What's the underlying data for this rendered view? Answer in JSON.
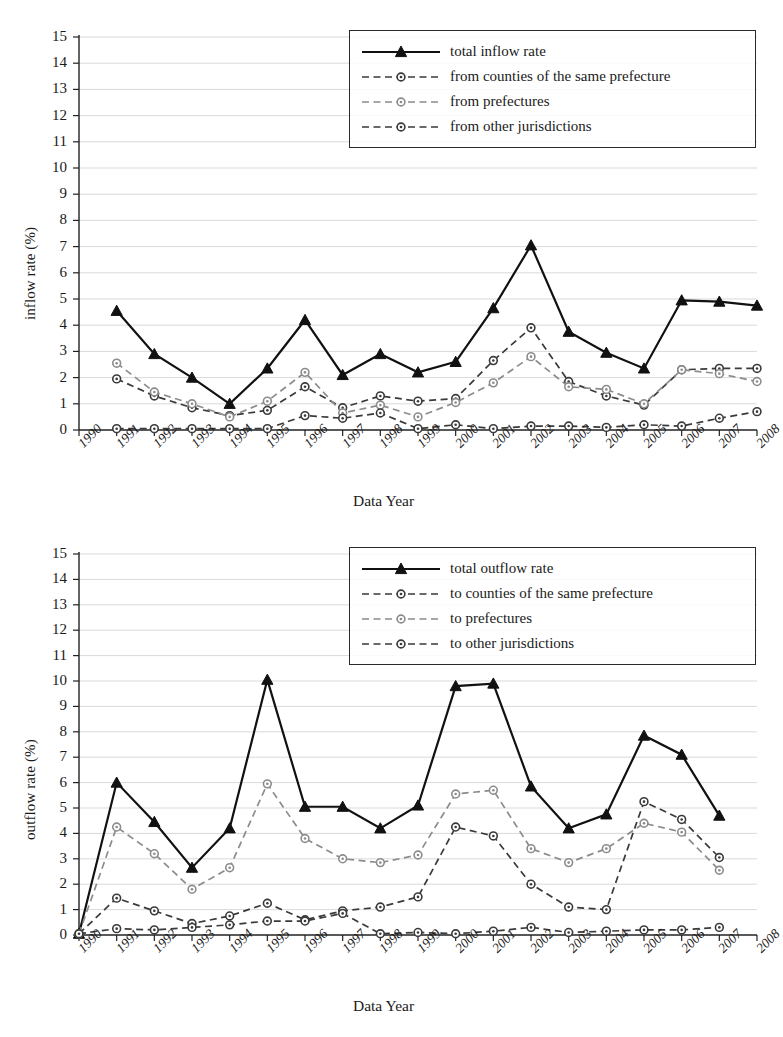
{
  "figure": {
    "panels": [
      {
        "id": "inflow",
        "ylabel": "inflow rate (%)",
        "xlabel": "Data Year",
        "legend": [
          {
            "label": "total inflow rate",
            "style": "solid-triangle"
          },
          {
            "label": "from counties of the same prefecture",
            "style": "dashed-circle-dark"
          },
          {
            "label": "from prefectures",
            "style": "dashed-circle-light"
          },
          {
            "label": "from other jurisdictions",
            "style": "dashed-circle-dark"
          }
        ]
      },
      {
        "id": "outflow",
        "ylabel": "outflow rate (%)",
        "xlabel": "Data Year",
        "legend": [
          {
            "label": "total outflow rate",
            "style": "solid-triangle"
          },
          {
            "label": "to counties of the same prefecture",
            "style": "dashed-circle-dark"
          },
          {
            "label": "to prefectures",
            "style": "dashed-circle-light"
          },
          {
            "label": "to other jurisdictions",
            "style": "dashed-circle-dark"
          }
        ]
      }
    ]
  },
  "chart_data": [
    {
      "type": "line",
      "id": "inflow",
      "title": "",
      "xlabel": "Data Year",
      "ylabel": "inflow rate (%)",
      "grid": true,
      "legend_position": "top-center",
      "xlim": [
        1990,
        2008
      ],
      "ylim": [
        0,
        15
      ],
      "yticks": [
        0,
        1,
        2,
        3,
        4,
        5,
        6,
        7,
        8,
        9,
        10,
        11,
        12,
        13,
        14,
        15
      ],
      "xticks": [
        1990,
        1991,
        1992,
        1993,
        1994,
        1995,
        1996,
        1997,
        1998,
        1999,
        2000,
        2001,
        2002,
        2003,
        2004,
        2005,
        2006,
        2007,
        2008
      ],
      "x": [
        1991,
        1992,
        1993,
        1994,
        1995,
        1996,
        1997,
        1998,
        1999,
        2000,
        2001,
        2002,
        2003,
        2004,
        2005,
        2006,
        2007,
        2008
      ],
      "series": [
        {
          "name": "total inflow rate",
          "style": "solid-triangle",
          "values": [
            4.55,
            2.9,
            2.0,
            1.0,
            2.35,
            4.2,
            2.1,
            2.9,
            2.2,
            2.6,
            4.65,
            7.05,
            3.75,
            2.95,
            2.35,
            4.95,
            4.9,
            4.75
          ]
        },
        {
          "name": "from counties of the same prefecture",
          "style": "dashed-circle-dark",
          "values": [
            1.95,
            1.3,
            0.85,
            0.55,
            0.75,
            1.65,
            0.85,
            1.3,
            1.1,
            1.2,
            2.65,
            3.9,
            1.85,
            1.3,
            0.95,
            2.3,
            2.35,
            2.35
          ]
        },
        {
          "name": "from prefectures",
          "style": "dashed-circle-light",
          "values": [
            2.55,
            1.45,
            1.0,
            0.5,
            1.1,
            2.2,
            0.65,
            0.95,
            0.5,
            1.05,
            1.8,
            2.8,
            1.65,
            1.55,
            1.0,
            2.3,
            2.15,
            1.85
          ]
        },
        {
          "name": "from other jurisdictions",
          "style": "dashed-circle-dark",
          "values": [
            0.05,
            0.05,
            0.05,
            0.05,
            0.05,
            0.55,
            0.45,
            0.65,
            0.05,
            0.2,
            0.05,
            0.15,
            0.15,
            0.1,
            0.2,
            0.15,
            0.45,
            0.7
          ]
        }
      ]
    },
    {
      "type": "line",
      "id": "outflow",
      "title": "",
      "xlabel": "Data Year",
      "ylabel": "outflow rate (%)",
      "grid": true,
      "legend_position": "top-center",
      "xlim": [
        1990,
        2008
      ],
      "ylim": [
        0,
        15
      ],
      "yticks": [
        0,
        1,
        2,
        3,
        4,
        5,
        6,
        7,
        8,
        9,
        10,
        11,
        12,
        13,
        14,
        15
      ],
      "xticks": [
        1990,
        1991,
        1992,
        1993,
        1994,
        1995,
        1996,
        1997,
        1998,
        1999,
        2000,
        2001,
        2002,
        2003,
        2004,
        2005,
        2006,
        2007,
        2008
      ],
      "x": [
        1990,
        1991,
        1992,
        1993,
        1994,
        1995,
        1996,
        1997,
        1998,
        1999,
        2000,
        2001,
        2002,
        2003,
        2004,
        2005,
        2006,
        2007
      ],
      "series": [
        {
          "name": "total outflow rate",
          "style": "solid-triangle",
          "values": [
            0.05,
            6.0,
            4.45,
            2.65,
            4.2,
            10.05,
            5.05,
            5.05,
            4.2,
            5.1,
            9.8,
            9.9,
            5.85,
            4.2,
            4.75,
            7.85,
            7.1,
            4.7
          ]
        },
        {
          "name": "to counties of the same prefecture",
          "style": "dashed-circle-dark",
          "values": [
            0.05,
            1.45,
            0.95,
            0.45,
            0.75,
            1.25,
            0.6,
            0.95,
            1.1,
            1.5,
            4.25,
            3.9,
            2.0,
            1.1,
            1.0,
            5.25,
            4.55,
            3.05
          ]
        },
        {
          "name": "to prefectures",
          "style": "dashed-circle-light",
          "values": [
            0.05,
            4.25,
            3.2,
            1.8,
            2.65,
            5.95,
            3.8,
            3.0,
            2.85,
            3.15,
            5.55,
            5.7,
            3.4,
            2.85,
            3.4,
            4.4,
            4.05,
            2.55
          ]
        },
        {
          "name": "to other jurisdictions",
          "style": "dashed-circle-dark",
          "values": [
            0.05,
            0.25,
            0.2,
            0.3,
            0.4,
            0.55,
            0.55,
            0.85,
            0.05,
            0.1,
            0.05,
            0.15,
            0.3,
            0.1,
            0.15,
            0.2,
            0.2,
            0.3
          ]
        }
      ]
    }
  ],
  "colors": {
    "total": "#111111",
    "counties": "#3a3a3a",
    "prefectures": "#8c8c8c",
    "other": "#3a3a3a",
    "grid": "#cfcfcf",
    "axis": "#222222",
    "text": "#1a1a1a"
  }
}
